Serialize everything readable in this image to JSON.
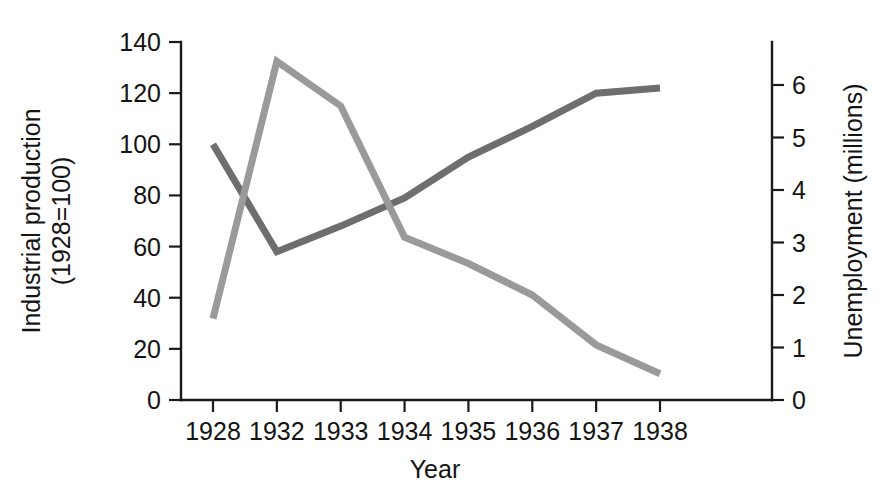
{
  "chart_data": {
    "type": "line",
    "title": "",
    "xlabel": "Year",
    "categories": [
      "1928",
      "1932",
      "1933",
      "1934",
      "1935",
      "1936",
      "1937",
      "1938"
    ],
    "grid": false,
    "legend": "none",
    "left_axis": {
      "label_line1": "Industrial production",
      "label_line2": "(1928=100)",
      "ticks": [
        0,
        20,
        40,
        60,
        80,
        100,
        120,
        140
      ],
      "tick_labels": [
        "0",
        "20",
        "40",
        "60",
        "80",
        "100",
        "120",
        "140"
      ],
      "ylim": [
        0,
        140
      ]
    },
    "right_axis": {
      "label": "Unemployment (millions)",
      "ticks": [
        0,
        1,
        2,
        3,
        4,
        5,
        6
      ],
      "tick_labels": [
        "0",
        "1",
        "2",
        "3",
        "4",
        "5",
        "6"
      ],
      "ylim": [
        0,
        6
      ]
    },
    "series": [
      {
        "name": "Industrial production (1928=100)",
        "axis": "left",
        "color": "#6e6e6e",
        "values": [
          100,
          58,
          68,
          79,
          95,
          107,
          120,
          122
        ]
      },
      {
        "name": "Unemployment (millions)",
        "axis": "right",
        "color": "#9a9a9a",
        "values": [
          1.55,
          6.45,
          5.6,
          3.1,
          2.6,
          2.0,
          1.05,
          0.5
        ]
      }
    ]
  }
}
